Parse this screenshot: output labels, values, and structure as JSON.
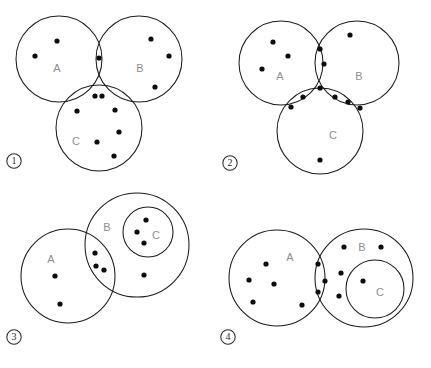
{
  "figure": {
    "type": "venn-diagram-multiple-choice",
    "background_color": "#ffffff",
    "stroke_color": "#1b1b1b",
    "dot_color": "#0d0d0d",
    "label_color": "#8e8e8e",
    "panel_number_color": "#2b2b2b"
  },
  "panels": [
    {
      "id": "panel-1",
      "number_label": "1",
      "number_marker": "①",
      "number_pos": {
        "x": 14,
        "y": 161
      },
      "layout": "three mutually overlapping circles",
      "circles": [
        {
          "set": "A",
          "cx": 59,
          "cy": 59,
          "r": 43,
          "label_x": 57,
          "label_y": 69
        },
        {
          "set": "B",
          "cx": 139,
          "cy": 59,
          "r": 43,
          "label_x": 140,
          "label_y": 69
        },
        {
          "set": "C",
          "cx": 99,
          "cy": 128,
          "r": 43,
          "label_x": 76,
          "label_y": 142
        }
      ],
      "dots": [
        {
          "x": 57,
          "y": 41,
          "region": "A-only"
        },
        {
          "x": 35,
          "y": 56,
          "region": "A-only"
        },
        {
          "x": 99,
          "y": 58,
          "region": "A-and-B"
        },
        {
          "x": 151,
          "y": 39,
          "region": "B-only"
        },
        {
          "x": 169,
          "y": 56,
          "region": "B-only"
        },
        {
          "x": 155,
          "y": 87,
          "region": "B-only"
        },
        {
          "x": 95,
          "y": 96,
          "region": "A-and-B-and-C"
        },
        {
          "x": 102,
          "y": 96,
          "region": "A-and-B-and-C"
        },
        {
          "x": 77,
          "y": 111,
          "region": "A-and-C"
        },
        {
          "x": 115,
          "y": 110,
          "region": "B-and-C"
        },
        {
          "x": 97,
          "y": 142,
          "region": "C-only"
        },
        {
          "x": 119,
          "y": 132,
          "region": "C-only"
        },
        {
          "x": 114,
          "y": 156,
          "region": "C-only"
        }
      ]
    },
    {
      "id": "panel-2",
      "number_label": "2",
      "number_marker": "②",
      "number_pos": {
        "x": 230,
        "y": 163
      },
      "layout": "three mutually overlapping circles",
      "circles": [
        {
          "set": "A",
          "cx": 281,
          "cy": 63,
          "r": 42,
          "label_x": 280,
          "label_y": 77
        },
        {
          "set": "B",
          "cx": 357,
          "cy": 63,
          "r": 42,
          "label_x": 359,
          "label_y": 77
        },
        {
          "set": "C",
          "cx": 320,
          "cy": 131,
          "r": 43,
          "label_x": 333,
          "label_y": 136
        }
      ],
      "dots": [
        {
          "x": 273,
          "y": 42,
          "region": "A-only"
        },
        {
          "x": 288,
          "y": 56,
          "region": "A-only"
        },
        {
          "x": 262,
          "y": 69,
          "region": "A-only"
        },
        {
          "x": 320,
          "y": 49,
          "region": "A-and-B"
        },
        {
          "x": 324,
          "y": 64,
          "region": "A-and-B"
        },
        {
          "x": 350,
          "y": 35,
          "region": "B-only"
        },
        {
          "x": 320,
          "y": 88,
          "region": "A-and-B-and-C"
        },
        {
          "x": 303,
          "y": 97,
          "region": "A-and-C"
        },
        {
          "x": 291,
          "y": 107,
          "region": "A-and-C"
        },
        {
          "x": 335,
          "y": 97,
          "region": "B-and-C"
        },
        {
          "x": 348,
          "y": 102,
          "region": "B-and-C"
        },
        {
          "x": 360,
          "y": 108,
          "region": "B-and-C"
        },
        {
          "x": 320,
          "y": 160,
          "region": "C-only"
        }
      ]
    },
    {
      "id": "panel-3",
      "number_label": "3",
      "number_marker": "③",
      "number_pos": {
        "x": 14,
        "y": 337
      },
      "layout": "A and B overlap; C is a subset nested inside B",
      "circles": [
        {
          "set": "A",
          "cx": 68,
          "cy": 276,
          "r": 47,
          "label_x": 51,
          "label_y": 260
        },
        {
          "set": "B",
          "cx": 137,
          "cy": 245,
          "r": 52,
          "label_x": 107,
          "label_y": 228
        },
        {
          "set": "C",
          "cx": 148,
          "cy": 232,
          "r": 25,
          "label_x": 156,
          "label_y": 236
        }
      ],
      "dots": [
        {
          "x": 55,
          "y": 276,
          "region": "A-only"
        },
        {
          "x": 60,
          "y": 304,
          "region": "A-only"
        },
        {
          "x": 95,
          "y": 253,
          "region": "A-and-B"
        },
        {
          "x": 96,
          "y": 266,
          "region": "A-and-B"
        },
        {
          "x": 104,
          "y": 270,
          "region": "A-and-B"
        },
        {
          "x": 146,
          "y": 220,
          "region": "C"
        },
        {
          "x": 137,
          "y": 232,
          "region": "C"
        },
        {
          "x": 144,
          "y": 243,
          "region": "C"
        },
        {
          "x": 144,
          "y": 275,
          "region": "B-only"
        }
      ]
    },
    {
      "id": "panel-4",
      "number_label": "4",
      "number_marker": "④",
      "number_pos": {
        "x": 228,
        "y": 337
      },
      "layout": "A and B overlap; C is a subset nested inside B",
      "circles": [
        {
          "set": "A",
          "cx": 277,
          "cy": 278,
          "r": 48,
          "label_x": 290,
          "label_y": 258
        },
        {
          "set": "B",
          "cx": 364,
          "cy": 278,
          "r": 49,
          "label_x": 362,
          "label_y": 248
        },
        {
          "set": "C",
          "cx": 375,
          "cy": 289,
          "r": 29,
          "label_x": 380,
          "label_y": 293
        }
      ],
      "dots": [
        {
          "x": 266,
          "y": 264,
          "region": "A-only"
        },
        {
          "x": 249,
          "y": 280,
          "region": "A-only"
        },
        {
          "x": 274,
          "y": 284,
          "region": "A-only"
        },
        {
          "x": 253,
          "y": 302,
          "region": "A-only"
        },
        {
          "x": 302,
          "y": 305,
          "region": "A-only"
        },
        {
          "x": 318,
          "y": 264,
          "region": "A-and-B"
        },
        {
          "x": 325,
          "y": 281,
          "region": "A-and-B"
        },
        {
          "x": 318,
          "y": 292,
          "region": "A-and-B"
        },
        {
          "x": 344,
          "y": 247,
          "region": "B-only"
        },
        {
          "x": 381,
          "y": 247,
          "region": "B-only"
        },
        {
          "x": 341,
          "y": 273,
          "region": "B-only"
        },
        {
          "x": 339,
          "y": 296,
          "region": "B-only"
        },
        {
          "x": 363,
          "y": 281,
          "region": "C"
        }
      ]
    }
  ]
}
